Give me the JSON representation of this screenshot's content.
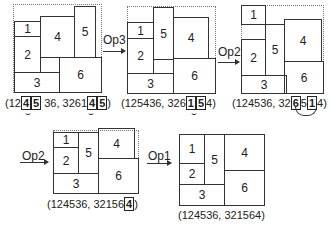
{
  "figures": [
    {
      "caption_pre": "(12",
      "caption_h1": "4",
      "caption_h2": "5",
      "caption_mid": " 36, 3261",
      "caption_h3": "4",
      "caption_h4": "5",
      "caption_post": ")",
      "rects": [
        {
          "label": "1"
        },
        {
          "label": "2"
        },
        {
          "label": "3"
        },
        {
          "label": "4"
        },
        {
          "label": "5"
        },
        {
          "label": "6"
        }
      ]
    },
    {
      "caption_pre": "(125436, 326",
      "caption_h1": "1",
      "caption_h2": "5",
      "caption_post": "4)",
      "rects": [
        {
          "label": "1"
        },
        {
          "label": "2"
        },
        {
          "label": "3"
        },
        {
          "label": "4"
        },
        {
          "label": "5"
        },
        {
          "label": "6"
        }
      ]
    },
    {
      "caption_pre": "(124536, 32",
      "caption_h1": "6",
      "caption_mid": "5",
      "caption_h2": "1",
      "caption_post": "4)",
      "rects": [
        {
          "label": "1"
        },
        {
          "label": "2"
        },
        {
          "label": "3"
        },
        {
          "label": "4"
        },
        {
          "label": "5"
        },
        {
          "label": "6"
        }
      ]
    },
    {
      "caption_pre": "(124536, 32156",
      "caption_h1": "4",
      "caption_post": ")",
      "rects": [
        {
          "label": "1"
        },
        {
          "label": "2"
        },
        {
          "label": "3"
        },
        {
          "label": "4"
        },
        {
          "label": "5"
        },
        {
          "label": "6"
        }
      ]
    },
    {
      "caption": "(124536, 321564)",
      "rects": [
        {
          "label": "1"
        },
        {
          "label": "2"
        },
        {
          "label": "3"
        },
        {
          "label": "4"
        },
        {
          "label": "5"
        },
        {
          "label": "6"
        }
      ]
    }
  ],
  "operations": [
    {
      "label": "Op3"
    },
    {
      "label": "Op2"
    },
    {
      "label": "Op2"
    },
    {
      "label": "Op1"
    }
  ],
  "swap_marks": [
    "⌣",
    "⌣",
    "⌣",
    "⌣"
  ]
}
